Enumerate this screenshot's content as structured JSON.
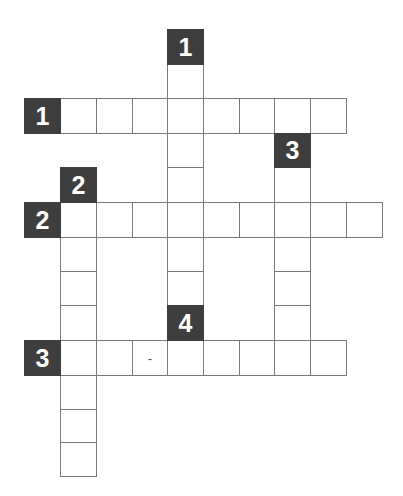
{
  "puzzle": {
    "type": "crossword",
    "colors": {
      "clue_bg": "#3e3e3e",
      "clue_fg": "#ffffff",
      "grid_line": "#7a7a7a",
      "cell_bg": "#ffffff"
    },
    "geometry": {
      "col_x": [
        24,
        60,
        96,
        132,
        167,
        203,
        239,
        274,
        310,
        346,
        382
      ],
      "row_y": [
        29,
        64,
        98,
        133,
        167,
        202,
        237,
        271,
        305,
        340,
        375,
        409,
        442,
        476
      ]
    },
    "clue_boxes": [
      {
        "number": "1",
        "direction": "down",
        "col": 4,
        "row": 0
      },
      {
        "number": "1",
        "direction": "across",
        "col": 0,
        "row": 2
      },
      {
        "number": "3",
        "direction": "down",
        "col": 7,
        "row": 3
      },
      {
        "number": "2",
        "direction": "down",
        "col": 1,
        "row": 4
      },
      {
        "number": "2",
        "direction": "across",
        "col": 0,
        "row": 5
      },
      {
        "number": "4",
        "direction": "down",
        "col": 4,
        "row": 8
      },
      {
        "number": "3",
        "direction": "across",
        "col": 0,
        "row": 9
      }
    ],
    "words": [
      {
        "id": "down-1",
        "col": 4,
        "row": 1,
        "dir": "down",
        "length": 7
      },
      {
        "id": "across-1",
        "col": 1,
        "row": 2,
        "dir": "across",
        "length": 8
      },
      {
        "id": "down-3",
        "col": 7,
        "row": 4,
        "dir": "down",
        "length": 6
      },
      {
        "id": "down-2",
        "col": 1,
        "row": 5,
        "dir": "down",
        "length": 8
      },
      {
        "id": "across-2",
        "col": 1,
        "row": 5,
        "dir": "across",
        "length": 9
      },
      {
        "id": "across-3",
        "col": 1,
        "row": 9,
        "dir": "across",
        "length": 8
      }
    ],
    "cell_marks": [
      {
        "col": 3,
        "row": 9,
        "text": "-"
      }
    ]
  }
}
